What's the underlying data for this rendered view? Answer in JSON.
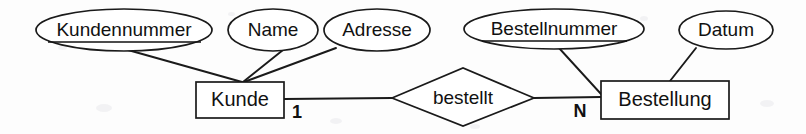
{
  "diagram": {
    "type": "entity-relationship-diagram",
    "notation": "chen",
    "language": "de",
    "background_color": "#fdfdfd",
    "stroke_color": "#1a1a1a",
    "text_color": "#111111"
  },
  "entities": [
    {
      "id": "kunde",
      "label": "Kunde",
      "shape": "rectangle",
      "x": 196,
      "y": 82,
      "width": 88,
      "height": 36
    },
    {
      "id": "bestellung",
      "label": "Bestellung",
      "shape": "rectangle",
      "x": 601,
      "y": 81,
      "width": 128,
      "height": 38
    }
  ],
  "relationships": [
    {
      "id": "bestellt",
      "label": "bestellt",
      "shape": "diamond",
      "cx": 463,
      "cy": 97,
      "rx": 71,
      "ry": 29,
      "from": "kunde",
      "to": "bestellung",
      "from_cardinality": "1",
      "to_cardinality": "N"
    }
  ],
  "attributes": [
    {
      "id": "kundennummer",
      "label": "Kundennummer",
      "shape": "ellipse",
      "primary_key": true,
      "owner": "kunde",
      "cx": 124,
      "cy": 30,
      "rx": 88,
      "ry": 21,
      "font_size": 19
    },
    {
      "id": "name",
      "label": "Name",
      "shape": "ellipse",
      "primary_key": false,
      "owner": "kunde",
      "cx": 273,
      "cy": 30,
      "rx": 45,
      "ry": 21,
      "font_size": 19
    },
    {
      "id": "adresse",
      "label": "Adresse",
      "shape": "ellipse",
      "primary_key": false,
      "owner": "kunde",
      "cx": 377,
      "cy": 30,
      "rx": 53,
      "ry": 21,
      "font_size": 19
    },
    {
      "id": "bestellnummer",
      "label": "Bestellnummer",
      "shape": "ellipse",
      "primary_key": true,
      "owner": "bestellung",
      "cx": 554,
      "cy": 29,
      "rx": 90,
      "ry": 20,
      "font_size": 19
    },
    {
      "id": "datum",
      "label": "Datum",
      "shape": "ellipse",
      "primary_key": false,
      "owner": "bestellung",
      "cx": 726,
      "cy": 30,
      "rx": 47,
      "ry": 19,
      "font_size": 19
    }
  ],
  "cardinality_labels": [
    {
      "id": "card-one",
      "text": "1",
      "x": 297,
      "y": 113
    },
    {
      "id": "card-n",
      "text": "N",
      "x": 580,
      "y": 112
    }
  ],
  "connectors": [
    {
      "id": "kundennummer-kunde",
      "from": "kundennummer",
      "to": "kunde",
      "x1": 128,
      "y1": 50,
      "x2": 242,
      "y2": 82
    },
    {
      "id": "name-kunde",
      "from": "name",
      "to": "kunde",
      "x1": 283,
      "y1": 50,
      "x2": 243,
      "y2": 82
    },
    {
      "id": "adresse-kunde",
      "from": "adresse",
      "to": "kunde",
      "x1": 336,
      "y1": 48,
      "x2": 244,
      "y2": 82
    },
    {
      "id": "kunde-bestellt",
      "from": "kunde",
      "to": "bestellt",
      "x1": 284,
      "y1": 99,
      "x2": 392,
      "y2": 98
    },
    {
      "id": "bestellt-bestellung",
      "from": "bestellt",
      "to": "bestellung",
      "x1": 534,
      "y1": 98,
      "x2": 601,
      "y2": 97
    },
    {
      "id": "bestellnummer-bestellung",
      "from": "bestellnummer",
      "to": "bestellung",
      "x1": 559,
      "y1": 48,
      "x2": 601,
      "y2": 94
    },
    {
      "id": "datum-bestellung",
      "from": "datum",
      "to": "bestellung",
      "x1": 696,
      "y1": 48,
      "x2": 670,
      "y2": 81
    }
  ]
}
